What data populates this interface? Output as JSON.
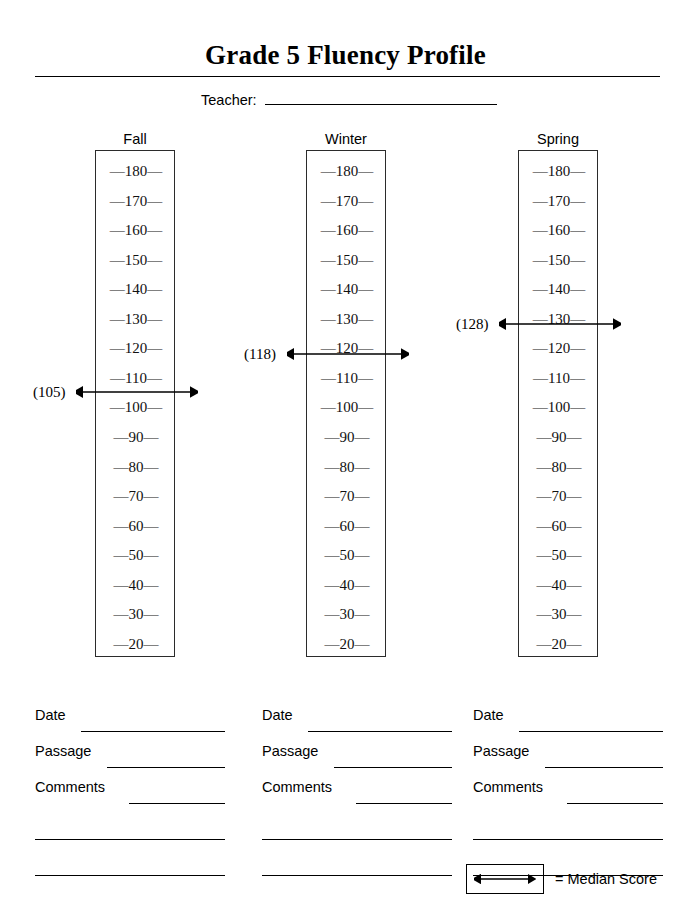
{
  "document": {
    "title": "Grade 5 Fluency Profile",
    "teacher": {
      "label": "Teacher:",
      "value": "",
      "placeholder": ""
    }
  },
  "scale": {
    "ticks": [
      180,
      170,
      160,
      150,
      140,
      130,
      120,
      110,
      100,
      90,
      80,
      70,
      60,
      50,
      40,
      30,
      20
    ],
    "tick_prefix": "—",
    "tick_suffix": "—",
    "min": 20,
    "max": 180,
    "step": 10
  },
  "columns": [
    {
      "header": "Fall",
      "median_label": "(105)",
      "median_value": 105,
      "fields": [
        {
          "label": "Date",
          "value": ""
        },
        {
          "label": "Passage",
          "value": ""
        },
        {
          "label": "Comments",
          "value": ""
        }
      ],
      "extra_blank_lines": 2
    },
    {
      "header": "Winter",
      "median_label": "(118)",
      "median_value": 118,
      "fields": [
        {
          "label": "Date",
          "value": ""
        },
        {
          "label": "Passage",
          "value": ""
        },
        {
          "label": "Comments",
          "value": ""
        }
      ],
      "extra_blank_lines": 2
    },
    {
      "header": "Spring",
      "median_label": "(128)",
      "median_value": 128,
      "fields": [
        {
          "label": "Date",
          "value": ""
        },
        {
          "label": "Passage",
          "value": ""
        },
        {
          "label": "Comments",
          "value": ""
        }
      ],
      "extra_blank_lines": 2
    }
  ],
  "legend": {
    "symbol": "double-headed-arrow",
    "text": "= Median Score"
  },
  "colors": {
    "ink": "#000000",
    "box_border": "#2b2b2b",
    "paper": "#ffffff"
  }
}
